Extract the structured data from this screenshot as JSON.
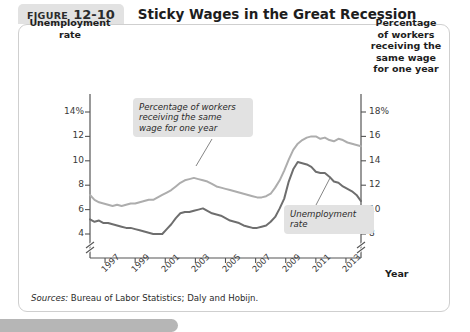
{
  "figure": {
    "tag_word": "FIGURE",
    "tag_number": "12-10",
    "title": "Sticky Wages in the Great Recession"
  },
  "sources": {
    "label": "Sources:",
    "text": " Bureau of Labor Statistics; Daly and Hobijn."
  },
  "annotations": {
    "wage": "Percentage of workers receiving the same wage for one year",
    "unemployment": "Unemployment rate"
  },
  "colors": {
    "unemployment_line": "#6e6e6e",
    "wage_line": "#adadad",
    "axis": "#555555",
    "card_border": "#cfcfcf",
    "tag_background": "#e2e2e2",
    "annotation_background": "#e2e2e2",
    "bottom_bar": "#b6b6b6"
  },
  "chart_data": {
    "type": "line",
    "title": "Sticky Wages in the Great Recession",
    "xlabel": "Year",
    "grid": false,
    "legend": "annotations-inline",
    "x_ticks": [
      "1997",
      "1999",
      "2001",
      "2003",
      "2005",
      "2007",
      "2009",
      "2011",
      "2013"
    ],
    "xlim": [
      1996.0,
      2014.0
    ],
    "left_axis": {
      "label": "Unemployment rate",
      "ticks": [
        "14%",
        "12",
        "10",
        "8",
        "6",
        "4"
      ],
      "tick_values": [
        14,
        12,
        10,
        8,
        6,
        4
      ],
      "lim": [
        3.4,
        14.8
      ],
      "axis_break": true,
      "unit": "percent"
    },
    "right_axis": {
      "label": "Percentage of workers receiving the same wage for one year",
      "ticks": [
        "18%",
        "16",
        "14",
        "12",
        "10",
        "8"
      ],
      "tick_values": [
        18,
        16,
        14,
        12,
        10,
        8
      ],
      "lim": [
        7.4,
        18.8
      ],
      "axis_break": true,
      "unit": "percent"
    },
    "series": [
      {
        "name": "Unemployment rate",
        "axis": "left",
        "color": "#6e6e6e",
        "x": [
          1996.0,
          1996.3,
          1996.6,
          1996.9,
          1997.2,
          1997.5,
          1997.8,
          1998.1,
          1998.4,
          1998.7,
          1999.0,
          1999.3,
          1999.6,
          1999.9,
          2000.2,
          2000.5,
          2000.8,
          2001.1,
          2001.4,
          2001.7,
          2002.0,
          2002.3,
          2002.6,
          2002.9,
          2003.2,
          2003.5,
          2003.8,
          2004.1,
          2004.4,
          2004.7,
          2005.0,
          2005.3,
          2005.6,
          2005.9,
          2006.2,
          2006.5,
          2006.8,
          2007.1,
          2007.4,
          2007.7,
          2008.0,
          2008.3,
          2008.6,
          2008.9,
          2009.2,
          2009.5,
          2009.8,
          2010.1,
          2010.4,
          2010.7,
          2011.0,
          2011.3,
          2011.6,
          2011.9,
          2012.2,
          2012.5,
          2012.8,
          2013.1,
          2013.4,
          2013.7,
          2014.0
        ],
        "values": [
          5.2,
          5.0,
          5.1,
          4.9,
          4.9,
          4.8,
          4.7,
          4.6,
          4.5,
          4.5,
          4.4,
          4.3,
          4.2,
          4.1,
          4.0,
          4.0,
          4.0,
          4.4,
          4.8,
          5.3,
          5.7,
          5.8,
          5.8,
          5.9,
          6.0,
          6.1,
          5.9,
          5.7,
          5.6,
          5.5,
          5.3,
          5.1,
          5.0,
          4.9,
          4.7,
          4.6,
          4.5,
          4.5,
          4.6,
          4.7,
          5.0,
          5.4,
          6.1,
          6.9,
          8.3,
          9.3,
          9.9,
          9.8,
          9.7,
          9.5,
          9.1,
          9.0,
          9.0,
          8.7,
          8.3,
          8.2,
          7.9,
          7.7,
          7.5,
          7.2,
          6.7
        ]
      },
      {
        "name": "Percentage of workers receiving the same wage for one year",
        "axis": "right",
        "color": "#adadad",
        "x": [
          1996.0,
          1996.3,
          1996.6,
          1996.9,
          1997.2,
          1997.5,
          1997.8,
          1998.1,
          1998.4,
          1998.7,
          1999.0,
          1999.3,
          1999.6,
          1999.9,
          2000.2,
          2000.5,
          2000.8,
          2001.1,
          2001.4,
          2001.7,
          2002.0,
          2002.3,
          2002.6,
          2002.9,
          2003.2,
          2003.5,
          2003.8,
          2004.1,
          2004.4,
          2004.7,
          2005.0,
          2005.3,
          2005.6,
          2005.9,
          2006.2,
          2006.5,
          2006.8,
          2007.1,
          2007.4,
          2007.7,
          2008.0,
          2008.3,
          2008.6,
          2008.9,
          2009.2,
          2009.5,
          2009.8,
          2010.1,
          2010.4,
          2010.7,
          2011.0,
          2011.3,
          2011.6,
          2011.9,
          2012.2,
          2012.5,
          2012.8,
          2013.1,
          2013.4,
          2013.7,
          2014.0
        ],
        "values": [
          11.2,
          10.8,
          10.6,
          10.5,
          10.4,
          10.3,
          10.4,
          10.3,
          10.4,
          10.5,
          10.5,
          10.6,
          10.7,
          10.8,
          10.8,
          11.0,
          11.2,
          11.4,
          11.6,
          11.9,
          12.2,
          12.4,
          12.5,
          12.6,
          12.5,
          12.4,
          12.3,
          12.1,
          11.9,
          11.8,
          11.7,
          11.6,
          11.5,
          11.4,
          11.3,
          11.2,
          11.1,
          11.0,
          11.0,
          11.1,
          11.3,
          11.8,
          12.4,
          13.2,
          14.1,
          14.9,
          15.4,
          15.7,
          15.9,
          16.0,
          16.0,
          15.8,
          15.9,
          15.7,
          15.6,
          15.8,
          15.7,
          15.5,
          15.4,
          15.3,
          15.2
        ]
      }
    ]
  }
}
